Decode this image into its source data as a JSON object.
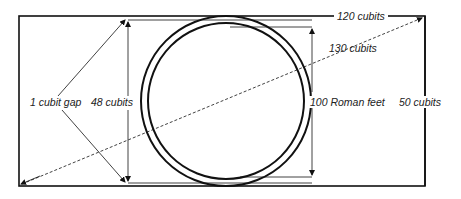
{
  "diagram": {
    "labels": {
      "length": "120 cubits",
      "diagonal": "130 cubits",
      "width": "50 cubits",
      "square_side": "100 Roman feet",
      "inner_height": "48 cubits",
      "gap": "1 cubit gap"
    },
    "colors": {
      "line": "#111111",
      "background": "#ffffff"
    }
  }
}
